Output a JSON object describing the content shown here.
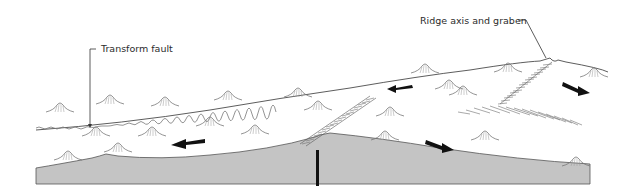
{
  "diagram": {
    "type": "block diagram (mid-ocean ridge with transform fault)",
    "labels": {
      "transform_fault": "Transform fault",
      "ridge_axis": "Ridge axis and graben"
    },
    "elements": {
      "arrows": [
        {
          "id": "arrow-upper-center",
          "direction": "left"
        },
        {
          "id": "arrow-upper-right",
          "direction": "right"
        },
        {
          "id": "arrow-lower-left",
          "direction": "left"
        },
        {
          "id": "arrow-lower-center",
          "direction": "right"
        }
      ],
      "cross_section_fill": "#c4c4c4",
      "line_color": "#333333",
      "hatch_color": "#6e6e6e"
    }
  }
}
